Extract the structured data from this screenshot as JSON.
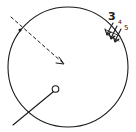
{
  "diagram": {
    "colors": {
      "ink": "#1a1a1a",
      "background": "#ffffff"
    },
    "labels": [
      "3",
      "4",
      "5"
    ],
    "elements": {
      "boundary": "circle",
      "dashed_arrow": "dashed arrow toward center",
      "solid_line": "line ending in open circle",
      "arrow_group": "three arrows pointing inward"
    }
  }
}
